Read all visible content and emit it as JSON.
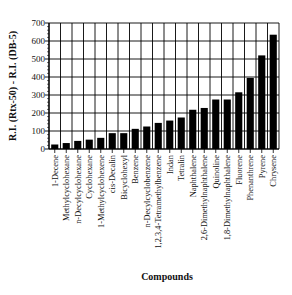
{
  "chart_data": {
    "type": "bar",
    "title": "",
    "xlabel": "Compounds",
    "ylabel": "R.I. (Rtx-50) - R.I. (DB-5)",
    "ylim": [
      0,
      700
    ],
    "yticks": [
      0,
      100,
      200,
      300,
      400,
      500,
      600,
      700
    ],
    "ytick_labels": [
      "0",
      "100",
      "200",
      "300",
      "400",
      "500",
      "600",
      "700"
    ],
    "grid": true,
    "legend": "none",
    "bar_color": "#000000",
    "categories": [
      "1-Decene",
      "Methylcyclohexane",
      "n-Decylcyclohexane",
      "Cyclohexane",
      "1-Methylcyclohexene",
      "cis-Decalin",
      "Bicyclohexyl",
      "Benzene",
      "n-Decylcyclobenzene",
      "1,2,3,4-Tetramethylbenzene",
      "Indan",
      "Tetralin",
      "Naphthalene",
      "2,6-Dimethylnaphthalene",
      "Quinoline",
      "1,8-Dimethylnaphthalene",
      "Fluorene",
      "Phenanthrene",
      "Pyrene",
      "Chrysene"
    ],
    "values": [
      25,
      33,
      45,
      52,
      62,
      88,
      88,
      112,
      125,
      145,
      158,
      175,
      218,
      228,
      275,
      275,
      315,
      395,
      520,
      635
    ]
  }
}
